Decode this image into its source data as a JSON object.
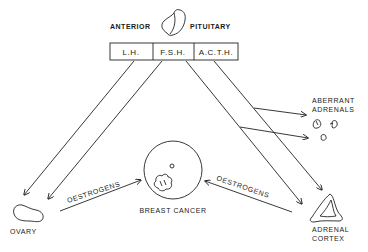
{
  "title": {
    "left": "ANTERIOR",
    "right": "PITUITARY"
  },
  "hormones": [
    "L.H.",
    "F.S.H.",
    "A.C.T.H."
  ],
  "targets": {
    "ovary": "OVARY",
    "breast_cancer": "BREAST CANCER",
    "adrenal_cortex_line1": "ADRENAL",
    "adrenal_cortex_line2": "CORTEX",
    "aberrant_line1": "ABERRANT",
    "aberrant_line2": "ADRENALS"
  },
  "flows": {
    "left": "OESTROGENS",
    "right": "OESTROGENS"
  },
  "colors": {
    "ink": "#222222",
    "background": "#ffffff"
  }
}
